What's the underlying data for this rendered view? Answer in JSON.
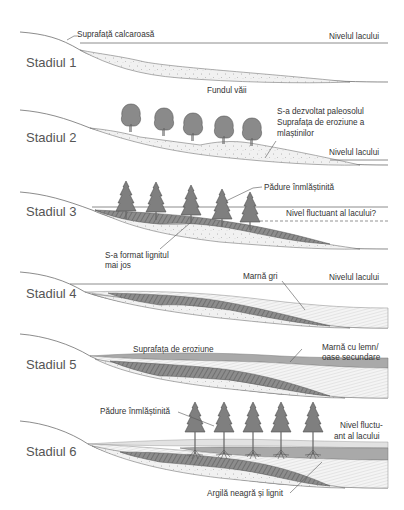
{
  "diagram": {
    "type": "geological-cross-section-sequence",
    "stages": [
      {
        "id": 1,
        "label": "Stadiul 1",
        "annotations": {
          "surface": "Suprafață calcaroasă",
          "lake_level": "Nivelul lacului",
          "valley_floor": "Fundul văii"
        }
      },
      {
        "id": 2,
        "label": "Stadiul 2",
        "annotations": {
          "paleosol_line1": "S-a dezvoltat paleosolul",
          "paleosol_line2": "Suprafața de eroziune a",
          "paleosol_line3": "mlaștinilor",
          "lake_level": "Nivelul lacului"
        },
        "tree_count": 5,
        "tree_type": "deciduous"
      },
      {
        "id": 3,
        "label": "Stadiul 3",
        "annotations": {
          "forest": "Pădure înmlăștinită",
          "fluctuating_level": "Nivel fluctuant al lacului?",
          "lignite_line1": "S-a format lignitul",
          "lignite_line2": "mai jos"
        },
        "tree_count": 5,
        "tree_type": "conifer"
      },
      {
        "id": 4,
        "label": "Stadiul 4",
        "annotations": {
          "grey_marl": "Marnă gri",
          "lake_level": "Nivelul lacului"
        }
      },
      {
        "id": 5,
        "label": "Stadiul 5",
        "annotations": {
          "erosion_surface": "Suprafața de eroziune",
          "marl_wood_line1": "Marnă cu lemn/",
          "marl_wood_line2": "oase secundare"
        }
      },
      {
        "id": 6,
        "label": "Stadiul 6",
        "annotations": {
          "forest": "Pădure înmlăștinită",
          "fluct_line1": "Nivel fluctu-",
          "fluct_line2": "ant al lacului",
          "clay_lignite": "Argilă neagră și lignit"
        },
        "tree_count": 5,
        "tree_type": "conifer"
      }
    ],
    "colors": {
      "background": "#ffffff",
      "line": "#6e6e6e",
      "text": "#333333",
      "stage_text": "#555555",
      "sand": "#efefef",
      "lignite": "#7a7a7a",
      "marl_wood": "#a9a9a9",
      "tree": "#808080"
    }
  }
}
